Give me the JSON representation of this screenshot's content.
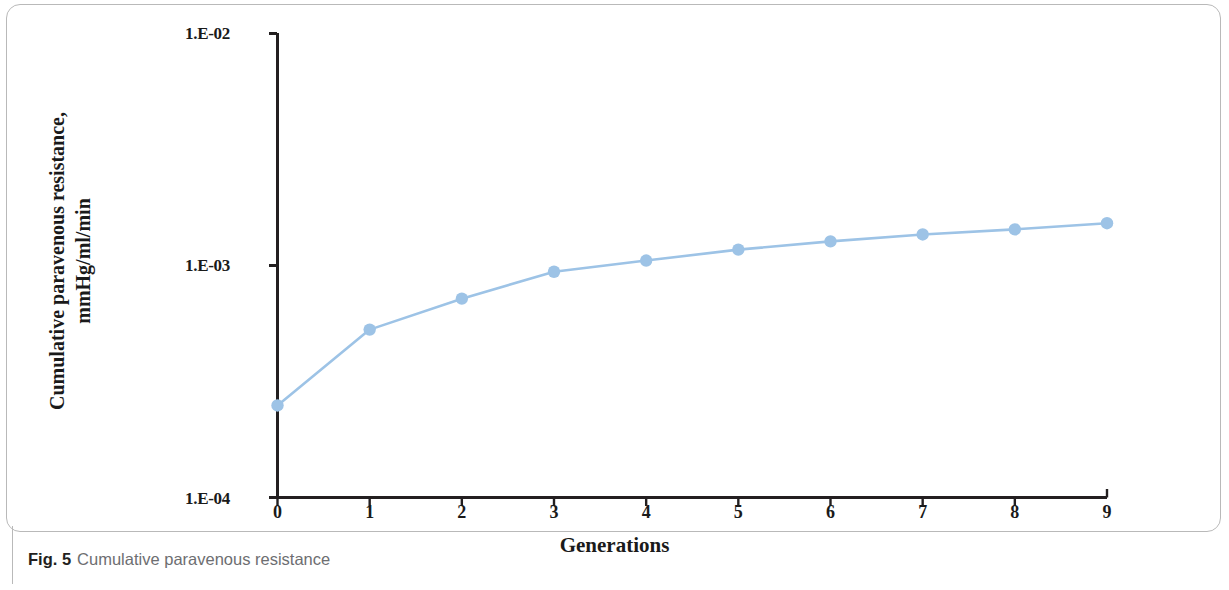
{
  "figure": {
    "caption_label": "Fig. 5",
    "caption_text": "Cumulative paravenous resistance"
  },
  "axes": {
    "y_title_line1": "Cumulative paravenous resistance,",
    "y_title_line2": "mmHg/ml/min",
    "x_title": "Generations",
    "y_ticks": [
      "1.E-02",
      "1.E-03",
      "1.E-04"
    ],
    "x_ticks": [
      "0",
      "1",
      "2",
      "3",
      "4",
      "5",
      "6",
      "7",
      "8",
      "9"
    ]
  },
  "style": {
    "series_color": "#9DC3E6",
    "axis_color": "#231f20",
    "caption_color": "#6d6e71"
  },
  "chart_data": {
    "type": "line",
    "title": "Cumulative paravenous resistance",
    "xlabel": "Generations",
    "ylabel": "Cumulative paravenous resistance, mmHg/ml/min",
    "x": [
      0,
      1,
      2,
      3,
      4,
      5,
      6,
      7,
      8,
      9
    ],
    "values": [
      0.00025,
      0.00053,
      0.00072,
      0.00094,
      0.00105,
      0.00117,
      0.00127,
      0.00136,
      0.00143,
      0.00152
    ],
    "yscale": "log",
    "ylim": [
      0.0001,
      0.01
    ],
    "xlim": [
      0,
      9
    ],
    "y_tick_values": [
      0.01,
      0.001,
      0.0001
    ],
    "grid": false,
    "legend": "none",
    "marker": "circle",
    "series": [
      {
        "name": "Cumulative paravenous resistance",
        "values": [
          0.00025,
          0.00053,
          0.00072,
          0.00094,
          0.00105,
          0.00117,
          0.00127,
          0.00136,
          0.00143,
          0.00152
        ]
      }
    ]
  }
}
